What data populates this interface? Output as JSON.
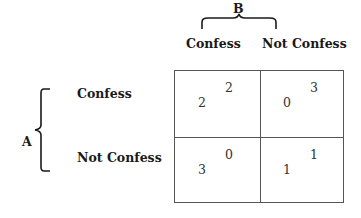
{
  "game": {
    "player_column": "B",
    "player_row": "A",
    "column_strategies": [
      "Confess",
      "Not Confess"
    ],
    "row_strategies": [
      "Confess",
      "Not Confess"
    ],
    "cells": [
      [
        {
          "payoff_a": "2",
          "payoff_b": "2"
        },
        {
          "payoff_a": "0",
          "payoff_b": "3"
        }
      ],
      [
        {
          "payoff_a": "3",
          "payoff_b": "0"
        },
        {
          "payoff_a": "1",
          "payoff_b": "1"
        }
      ]
    ]
  },
  "colors": {
    "text": "#1a1a1a",
    "grid": "#555555",
    "background": "#ffffff"
  }
}
